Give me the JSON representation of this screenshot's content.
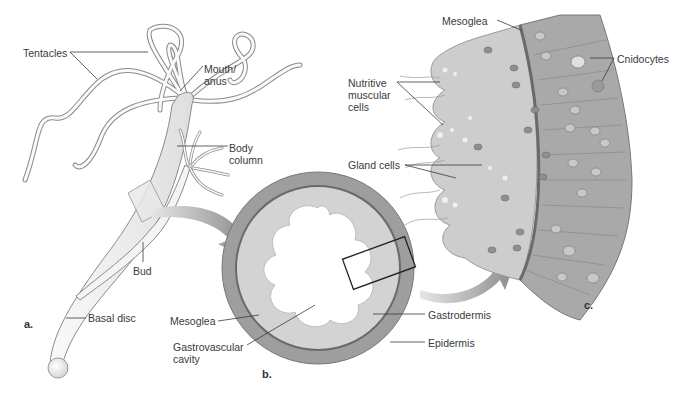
{
  "figure": {
    "panels": [
      {
        "id": "a",
        "label": "a."
      },
      {
        "id": "b",
        "label": "b."
      },
      {
        "id": "c",
        "label": "c."
      }
    ],
    "labels_a": {
      "tentacles": "Tentacles",
      "mouth_anus": "Mouth/\nanus",
      "body_column": "Body\ncolumn",
      "bud": "Bud",
      "basal_disc": "Basal disc"
    },
    "labels_b": {
      "mesoglea": "Mesoglea",
      "gastrovascular_cavity": "Gastrovascular\ncavity",
      "gastrodermis": "Gastrodermis",
      "epidermis": "Epidermis"
    },
    "labels_c": {
      "mesoglea": "Mesoglea",
      "cnidocytes": "Cnidocytes",
      "nutritive_muscular_cells": "Nutritive\nmuscular\ncells",
      "gland_cells": "Gland cells"
    },
    "colors": {
      "body_fill": "#f2f2f2",
      "outline": "#8a8a8a",
      "gastrodermis": "#cfcfcf",
      "epidermis": "#9e9e9e",
      "arrow": "#9a9a9a",
      "leader": "#3a3a3a"
    }
  }
}
